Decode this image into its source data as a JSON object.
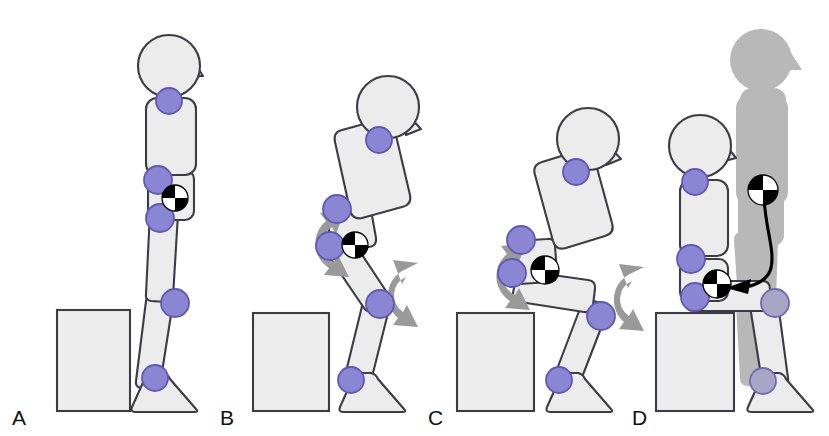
{
  "figure": {
    "background_color": "#ffffff",
    "width": 829,
    "height": 436
  },
  "style": {
    "segment_fill": "#ececec",
    "segment_stroke": "#3c3c46",
    "joint_fill": "#8b86d4",
    "joint_stroke": "#5f58b4",
    "ghost_fill": "#b8b8b8",
    "rotation_arrow_color": "#9a9a9a",
    "trajectory_color": "#000000",
    "chair_fill": "#ededed",
    "com_black": "#000000",
    "com_white": "#ffffff"
  },
  "panels": [
    {
      "id": "A",
      "label": "A",
      "phase": "Quiet standing",
      "trunk_orientation": "upright",
      "knee_flexion": "minimal",
      "has_rotation_arrows": false,
      "has_ghost_figure": false,
      "has_trajectory": false,
      "com_count": 1,
      "chair_present": true,
      "joint_names": [
        "neck",
        "hip",
        "pelvis-lower",
        "knee",
        "ankle"
      ]
    },
    {
      "id": "B",
      "label": "B",
      "phase": "Trunk flexion, momentum generation",
      "trunk_orientation": "leaning forward",
      "knee_flexion": "slight",
      "has_rotation_arrows": true,
      "has_ghost_figure": false,
      "has_trajectory": false,
      "com_count": 1,
      "chair_present": true,
      "rotation_arrows": [
        "hip",
        "knee"
      ],
      "joint_names": [
        "neck",
        "hip",
        "pelvis-lower",
        "knee",
        "ankle"
      ]
    },
    {
      "id": "C",
      "label": "C",
      "phase": "Descent, hip and knee flexion",
      "trunk_orientation": "leaning forward",
      "knee_flexion": "moderate",
      "has_rotation_arrows": true,
      "has_ghost_figure": false,
      "has_trajectory": false,
      "com_count": 1,
      "chair_present": true,
      "rotation_arrows": [
        "hip",
        "knee"
      ],
      "joint_names": [
        "neck",
        "hip",
        "pelvis-lower",
        "knee",
        "ankle"
      ]
    },
    {
      "id": "D",
      "label": "D",
      "phase": "Seated, centre-of-mass path shown",
      "trunk_orientation": "upright seated",
      "knee_flexion": "ninety degrees",
      "has_rotation_arrows": false,
      "has_ghost_figure": true,
      "has_trajectory": true,
      "com_count": 2,
      "chair_present": true,
      "ghost_description": "grey silhouette of the standing posture from panel A",
      "trajectory_description": "curved arrow tracing the centre-of-mass path from the standing position down and forward to the seated position",
      "joint_names": [
        "neck",
        "hip",
        "pelvis-lower",
        "knee",
        "ankle"
      ]
    }
  ],
  "markers": {
    "com_symbol_name": "centre-of-mass",
    "com_symbol_description": "circle quartered in alternating black and white",
    "joint_marker_name": "joint-marker"
  }
}
